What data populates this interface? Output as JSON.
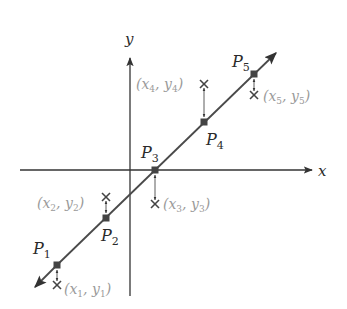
{
  "diagram": {
    "type": "least-squares regression line with data points and fitted points",
    "axes": {
      "x_label": "x",
      "y_label": "y"
    },
    "fitted_points": [
      {
        "label": "P",
        "sub": "1",
        "px": 57,
        "py": 265,
        "lx": 32,
        "ly": 252
      },
      {
        "label": "P",
        "sub": "2",
        "px": 106,
        "py": 218,
        "lx": 101,
        "ly": 241
      },
      {
        "label": "P",
        "sub": "3",
        "px": 155,
        "py": 170,
        "lx": 140,
        "ly": 156
      },
      {
        "label": "P",
        "sub": "4",
        "px": 204,
        "py": 122,
        "lx": 206,
        "ly": 146
      },
      {
        "label": "P",
        "sub": "5",
        "px": 254,
        "py": 74,
        "lx": 232,
        "ly": 66
      }
    ],
    "data_points": [
      {
        "label": "(x1, y1)",
        "x_sub": "1",
        "y_sub": "1",
        "px": 57,
        "py": 285
      },
      {
        "label": "(x2, y2)",
        "x_sub": "2",
        "y_sub": "2",
        "px": 106,
        "py": 197
      },
      {
        "label": "(x3, y3)",
        "x_sub": "3",
        "y_sub": "3",
        "px": 155,
        "py": 204
      },
      {
        "label": "(x4, y4)",
        "x_sub": "4",
        "y_sub": "4",
        "px": 204,
        "py": 84
      },
      {
        "label": "(x5, y5)",
        "x_sub": "5",
        "y_sub": "5",
        "px": 254,
        "py": 95
      }
    ],
    "colors": {
      "line": "#4a4a4a",
      "axes": "#333333",
      "point": "#333333",
      "data_label": "#9a9a9a"
    }
  }
}
